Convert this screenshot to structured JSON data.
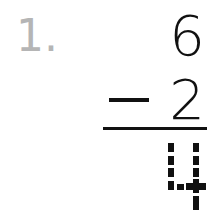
{
  "problem": {
    "number_label": "1.",
    "minuend": "6",
    "subtrahend": "2",
    "operator": "−",
    "answer": "4",
    "answer_style": "dotted-trace"
  }
}
